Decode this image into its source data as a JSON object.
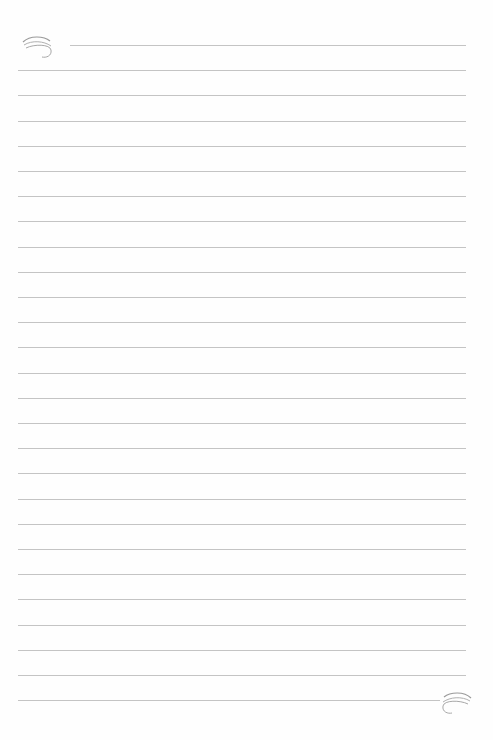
{
  "page": {
    "type": "lined-paper",
    "background": "#fefefe",
    "line_color": "#c4c4c4",
    "line_count": 27,
    "line_spacing_px": 25.2,
    "first_line_y": 45,
    "line_left_x": 18,
    "line_right_x": 466,
    "first_line_left_x": 70,
    "last_line_right_x": 440
  },
  "decorations": {
    "top_left": "swirl-flourish",
    "bottom_right": "swirl-flourish"
  }
}
